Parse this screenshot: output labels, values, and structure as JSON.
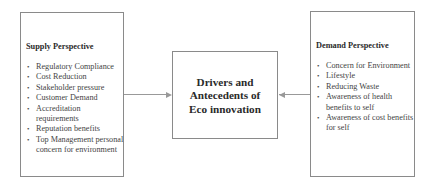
{
  "supply": {
    "title": "Supply Perspective",
    "items": [
      "Regulatory Compliance",
      "Cost Reduction",
      "Stakeholder pressure",
      "Customer Demand",
      "Accreditation requirements",
      "Reputation benefits",
      "Top Management personal concern for environment"
    ]
  },
  "center": {
    "line1": "Drivers and",
    "line2": "Antecedents of",
    "line3": "Eco innovation"
  },
  "demand": {
    "title": "Demand Perspective",
    "items": [
      "Concern for Environment",
      "Lifestyle",
      "Reducing Waste",
      "Awareness of health benefits to self",
      "Awareness of cost benefits for self"
    ]
  },
  "colors": {
    "border": "#8a8a8a",
    "arrow": "#999999",
    "text": "#333333"
  }
}
